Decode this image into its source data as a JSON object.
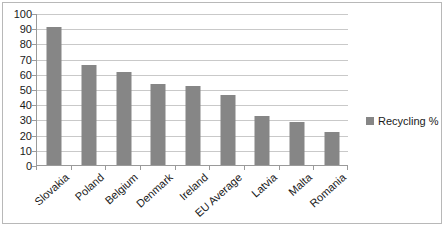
{
  "chart_data": {
    "type": "bar",
    "title": "",
    "subtitle": "",
    "xlabel": "",
    "ylabel": "",
    "categories": [
      "Slovakia",
      "Poland",
      "Belgium",
      "Denmark",
      "Ireland",
      "EU Average",
      "Latvia",
      "Malta",
      "Romania"
    ],
    "values": [
      91,
      66,
      61,
      53,
      52,
      46,
      32,
      28,
      22
    ],
    "series": [
      {
        "name": "Recycling %",
        "values": [
          91,
          66,
          61,
          53,
          52,
          46,
          32,
          28,
          22
        ],
        "color": "#868686"
      }
    ],
    "ylim": [
      0,
      100
    ],
    "ytick_step": 10,
    "yticks": [
      0,
      10,
      20,
      30,
      40,
      50,
      60,
      70,
      80,
      90,
      100
    ],
    "ytick_labels": [
      "0",
      "10",
      "20",
      "30",
      "40",
      "50",
      "60",
      "70",
      "80",
      "90",
      "100"
    ],
    "grid": true,
    "grid_axis": "y",
    "legend": {
      "position": "right",
      "entries": [
        {
          "label": "Recycling %",
          "color": "#868686"
        }
      ]
    },
    "colors": {
      "bar": "#868686",
      "gridline": "#c9c9c9",
      "axis": "#9a9a9a",
      "border": "#b8b8b8",
      "background": "#ffffff",
      "text": "#1a1a1a"
    }
  }
}
